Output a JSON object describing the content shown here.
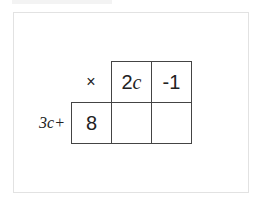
{
  "diagram": {
    "type": "area-model-multiplication-grid",
    "operator_symbol": "×",
    "row_label": "3c+",
    "column_headers": [
      {
        "coef": "2",
        "var": "c"
      },
      {
        "text": "-1"
      }
    ],
    "row_headers": [
      "8"
    ],
    "cells": [
      [
        "",
        ""
      ]
    ]
  }
}
